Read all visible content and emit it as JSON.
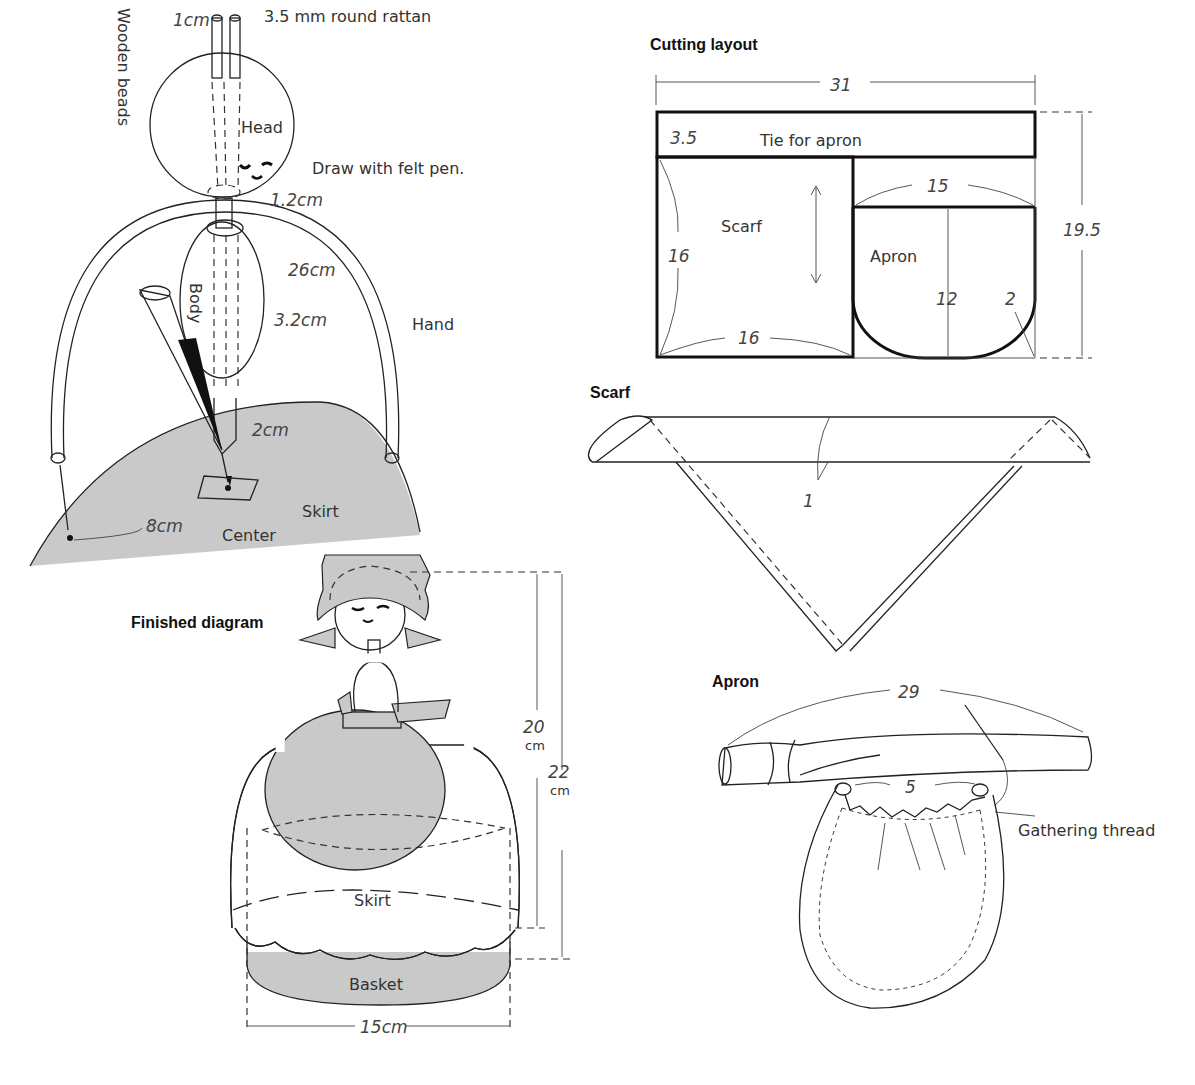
{
  "colors": {
    "line": "#222222",
    "fill_gray": "#c9c9c9",
    "background": "#ffffff"
  },
  "assembly": {
    "rattan_dim": "1cm",
    "rattan_label": "3.5 mm round rattan",
    "head_label": "Head",
    "felt_pen_label": "Draw with felt pen.",
    "wooden_beads_label": "Wooden beads",
    "neck_dim": "1.2cm",
    "arm_dim": "26cm",
    "body_label": "Body",
    "body_dim": "3.2cm",
    "hand_label": "Hand",
    "bottom_dim": "2cm",
    "radius_dim": "8cm",
    "skirt_label": "Skirt",
    "center_label": "Center"
  },
  "cutting_layout": {
    "title": "Cutting layout",
    "width": "31",
    "height": "19.5",
    "tie_height": "3.5",
    "tie_label": "Tie for apron",
    "scarf_label": "Scarf",
    "scarf_height": "16",
    "scarf_width": "16",
    "apron_width": "15",
    "apron_label": "Apron",
    "apron_height": "12",
    "corner_radius": "2"
  },
  "scarf": {
    "title": "Scarf",
    "hem": "1"
  },
  "apron": {
    "title": "Apron",
    "tie_length": "29",
    "gather_width": "5",
    "gathering_label": "Gathering thread"
  },
  "finished": {
    "title": "Finished diagram",
    "height_inner": "20",
    "height_inner_unit": "cm",
    "height_total": "22",
    "height_total_unit": "cm",
    "skirt_label": "Skirt",
    "basket_label": "Basket",
    "width": "15cm"
  }
}
